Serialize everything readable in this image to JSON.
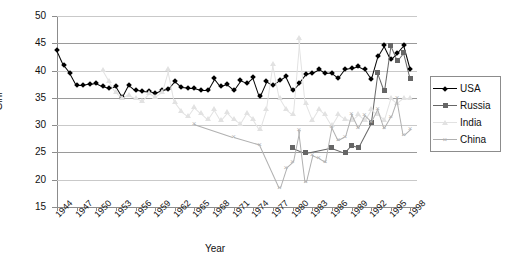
{
  "chart_data": {
    "type": "line",
    "title": "",
    "xlabel": "Year",
    "ylabel": "Gini",
    "xlim": [
      1944,
      1999
    ],
    "ylim": [
      15,
      50
    ],
    "ytick_labels": [
      "50",
      "45",
      "40",
      "35",
      "30",
      "25",
      "20",
      "15"
    ],
    "ytick_values": [
      50,
      45,
      40,
      35,
      30,
      25,
      20,
      15
    ],
    "xtick_labels": [
      "1944",
      "1947",
      "1950",
      "1953",
      "1956",
      "1959",
      "1962",
      "1965",
      "1968",
      "1971",
      "1974",
      "1977",
      "1980",
      "1983",
      "1986",
      "1989",
      "1992",
      "1995",
      "1998"
    ],
    "xtick_values": [
      1944,
      1947,
      1950,
      1953,
      1956,
      1959,
      1962,
      1965,
      1968,
      1971,
      1974,
      1977,
      1980,
      1983,
      1986,
      1989,
      1992,
      1995,
      1998
    ],
    "grid": true,
    "legend_position": "right",
    "colors": {
      "usa": "#000000",
      "russia": "#666666",
      "india": "#e2e2e2",
      "china": "#b0b0b0"
    },
    "series": [
      {
        "name": "USA",
        "marker": "diamond",
        "color": "#000000",
        "points": [
          [
            1944,
            43.7
          ],
          [
            1945,
            41.0
          ],
          [
            1946,
            39.5
          ],
          [
            1947,
            37.3
          ],
          [
            1948,
            37.3
          ],
          [
            1949,
            37.6
          ],
          [
            1950,
            37.8
          ],
          [
            1951,
            37.2
          ],
          [
            1952,
            36.8
          ],
          [
            1953,
            37.1
          ],
          [
            1954,
            35.1
          ],
          [
            1955,
            37.4
          ],
          [
            1956,
            36.4
          ],
          [
            1957,
            36.3
          ],
          [
            1958,
            36.2
          ],
          [
            1959,
            35.9
          ],
          [
            1960,
            36.4
          ],
          [
            1961,
            36.6
          ],
          [
            1962,
            38.0
          ],
          [
            1963,
            36.9
          ],
          [
            1964,
            36.8
          ],
          [
            1965,
            36.8
          ],
          [
            1966,
            36.5
          ],
          [
            1967,
            36.5
          ],
          [
            1968,
            38.6
          ],
          [
            1969,
            37.1
          ],
          [
            1970,
            37.5
          ],
          [
            1971,
            36.5
          ],
          [
            1972,
            38.2
          ],
          [
            1973,
            37.7
          ],
          [
            1974,
            38.8
          ],
          [
            1975,
            35.3
          ],
          [
            1976,
            38.0
          ],
          [
            1977,
            37.3
          ],
          [
            1978,
            38.2
          ],
          [
            1979,
            39.0
          ],
          [
            1980,
            36.4
          ],
          [
            1981,
            37.7
          ],
          [
            1982,
            39.3
          ],
          [
            1983,
            39.6
          ],
          [
            1984,
            40.2
          ],
          [
            1985,
            39.5
          ],
          [
            1986,
            39.6
          ],
          [
            1987,
            38.7
          ],
          [
            1988,
            40.3
          ],
          [
            1989,
            40.5
          ],
          [
            1990,
            40.8
          ],
          [
            1991,
            40.2
          ],
          [
            1992,
            38.4
          ],
          [
            1993,
            42.6
          ],
          [
            1994,
            44.6
          ],
          [
            1995,
            42.1
          ],
          [
            1996,
            43.2
          ],
          [
            1997,
            44.6
          ],
          [
            1998,
            40.2
          ]
        ]
      },
      {
        "name": "Russia",
        "marker": "square",
        "color": "#666666",
        "points": [
          [
            1980,
            25.9
          ],
          [
            1982,
            24.9
          ],
          [
            1986,
            25.9
          ],
          [
            1988,
            25.0
          ],
          [
            1989,
            26.3
          ],
          [
            1990,
            25.9
          ],
          [
            1992,
            30.5
          ],
          [
            1993,
            39.6
          ],
          [
            1994,
            36.3
          ],
          [
            1995,
            44.6
          ],
          [
            1996,
            41.8
          ],
          [
            1997,
            43.3
          ],
          [
            1998,
            38.6
          ]
        ]
      },
      {
        "name": "India",
        "marker": "triangle",
        "color": "#e2e2e2",
        "points": [
          [
            1951,
            40.1
          ],
          [
            1952,
            38.0
          ],
          [
            1953,
            36.0
          ],
          [
            1954,
            34.9
          ],
          [
            1955,
            35.6
          ],
          [
            1956,
            35.0
          ],
          [
            1957,
            34.5
          ],
          [
            1958,
            35.8
          ],
          [
            1959,
            35.1
          ],
          [
            1960,
            36.0
          ],
          [
            1961,
            40.2
          ],
          [
            1962,
            34.2
          ],
          [
            1963,
            32.6
          ],
          [
            1964,
            31.7
          ],
          [
            1965,
            33.4
          ],
          [
            1966,
            32.3
          ],
          [
            1967,
            31.2
          ],
          [
            1968,
            33.0
          ],
          [
            1969,
            31.0
          ],
          [
            1970,
            32.4
          ],
          [
            1971,
            31.1
          ],
          [
            1972,
            30.3
          ],
          [
            1973,
            32.3
          ],
          [
            1974,
            31.2
          ],
          [
            1975,
            29.3
          ],
          [
            1976,
            33.0
          ],
          [
            1977,
            41.2
          ],
          [
            1978,
            35.0
          ],
          [
            1979,
            33.0
          ],
          [
            1980,
            32.0
          ],
          [
            1981,
            46.0
          ],
          [
            1982,
            34.0
          ],
          [
            1983,
            31.0
          ],
          [
            1984,
            33.0
          ],
          [
            1985,
            32.0
          ],
          [
            1986,
            30.0
          ],
          [
            1987,
            32.0
          ],
          [
            1988,
            31.2
          ],
          [
            1989,
            31.0
          ],
          [
            1990,
            32.0
          ],
          [
            1991,
            31.0
          ],
          [
            1992,
            33.0
          ],
          [
            1993,
            32.0
          ],
          [
            1994,
            31.0
          ],
          [
            1995,
            35.0
          ],
          [
            1996,
            34.0
          ],
          [
            1997,
            35.0
          ],
          [
            1998,
            35.0
          ]
        ]
      },
      {
        "name": "China",
        "marker": "x",
        "color": "#b0b0b0",
        "points": [
          [
            1965,
            30.2
          ],
          [
            1971,
            27.8
          ],
          [
            1975,
            26.4
          ],
          [
            1978,
            18.5
          ],
          [
            1979,
            22.2
          ],
          [
            1980,
            23.3
          ],
          [
            1981,
            29.2
          ],
          [
            1982,
            19.5
          ],
          [
            1983,
            24.5
          ],
          [
            1984,
            24.0
          ],
          [
            1985,
            23.3
          ],
          [
            1986,
            29.7
          ],
          [
            1987,
            27.2
          ],
          [
            1988,
            27.8
          ],
          [
            1989,
            32.0
          ],
          [
            1990,
            29.5
          ],
          [
            1991,
            31.8
          ],
          [
            1992,
            30.6
          ],
          [
            1993,
            33.0
          ],
          [
            1994,
            29.4
          ],
          [
            1995,
            31.5
          ],
          [
            1996,
            35.0
          ],
          [
            1997,
            28.2
          ],
          [
            1998,
            29.3
          ]
        ]
      }
    ]
  },
  "legend": {
    "entries": [
      {
        "label": "USA"
      },
      {
        "label": "Russia"
      },
      {
        "label": "India"
      },
      {
        "label": "China"
      }
    ]
  }
}
